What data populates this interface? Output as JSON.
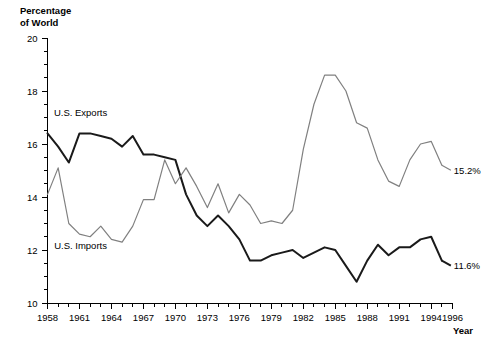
{
  "chart_data": {
    "type": "line",
    "title": "",
    "xlabel": "Year",
    "ylabel": "Percentage of World",
    "ylabel_lines": [
      "Percentage",
      "of World"
    ],
    "xlim": [
      1958,
      1996
    ],
    "ylim": [
      10,
      20
    ],
    "ytick_step": 2,
    "yminor_step": 0.5,
    "xtick_step": 1,
    "xlabel_step": 3,
    "grid": false,
    "legend_position": "inline-annotation",
    "yticks": [
      10,
      12,
      14,
      16,
      18,
      20
    ],
    "xticks": [
      1958,
      1961,
      1964,
      1967,
      1970,
      1973,
      1976,
      1979,
      1982,
      1985,
      1988,
      1991,
      1994,
      1996
    ],
    "x": [
      1958,
      1959,
      1960,
      1961,
      1962,
      1963,
      1964,
      1965,
      1966,
      1967,
      1968,
      1969,
      1970,
      1971,
      1972,
      1973,
      1974,
      1975,
      1976,
      1977,
      1978,
      1979,
      1980,
      1981,
      1982,
      1983,
      1984,
      1985,
      1986,
      1987,
      1988,
      1989,
      1990,
      1991,
      1992,
      1993,
      1994,
      1995
    ],
    "series": [
      {
        "name": "U.S. Exports",
        "color": "#1a1a1a",
        "width": 2.0,
        "label_x": 1961.1,
        "label_y": 17.05,
        "end_label": "11.6%",
        "end_value": 11.6,
        "values": [
          16.4,
          15.9,
          15.3,
          16.4,
          16.4,
          16.3,
          16.2,
          15.9,
          16.3,
          15.6,
          15.6,
          15.5,
          15.4,
          14.1,
          13.3,
          12.9,
          13.3,
          12.9,
          12.4,
          11.6,
          11.6,
          11.8,
          11.9,
          12.0,
          11.7,
          11.9,
          12.1,
          12.0,
          11.4,
          10.8,
          11.6,
          12.2,
          11.8,
          12.1,
          12.1,
          12.4,
          12.5,
          11.6
        ]
      },
      {
        "name": "U.S. Imports",
        "color": "#808080",
        "width": 1.2,
        "label_x": 1961.1,
        "label_y": 12.05,
        "end_label": "15.2%",
        "end_value": 15.2,
        "values": [
          14.1,
          15.1,
          13.0,
          12.6,
          12.5,
          12.9,
          12.4,
          12.3,
          12.9,
          13.9,
          13.9,
          15.4,
          14.5,
          15.1,
          14.4,
          13.6,
          14.5,
          13.4,
          14.1,
          13.7,
          13.0,
          13.1,
          13.0,
          13.5,
          15.8,
          17.5,
          18.6,
          18.6,
          18.0,
          16.8,
          16.6,
          15.4,
          14.6,
          14.4,
          15.4,
          16.0,
          16.1,
          15.2
        ]
      }
    ]
  }
}
